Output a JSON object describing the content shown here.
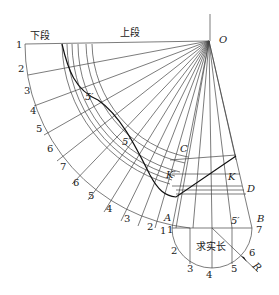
{
  "figure": {
    "title_lower_segment": "下段",
    "title_upper_segment": "上段",
    "apex_label": "O",
    "center_text": "求实长",
    "radius_label": "R",
    "points": {
      "C": "C",
      "D": "D",
      "K": "K",
      "K_prime": "K′",
      "A": "A",
      "B": "B",
      "five_prime_1": "5′",
      "five_prime_2": "5′",
      "five_prime_3": "5′"
    },
    "left_numbers": [
      "1",
      "2",
      "3",
      "4",
      "5",
      "6",
      "7"
    ],
    "lower_arc_numbers": [
      "6",
      "5",
      "4",
      "3",
      "2",
      "1"
    ],
    "semicircle_numbers": [
      "1",
      "2",
      "3",
      "4",
      "5",
      "6",
      "7"
    ],
    "line_color": "#333333",
    "bold_line_color": "#111111"
  }
}
